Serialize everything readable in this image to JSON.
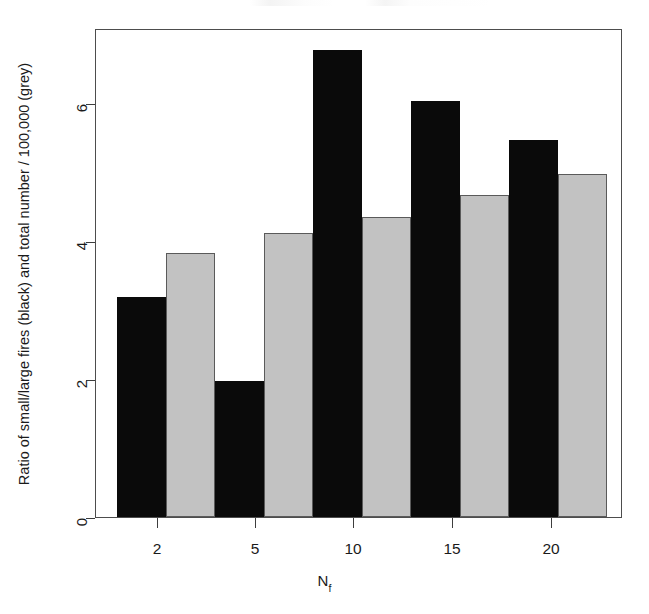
{
  "chart_data": {
    "type": "bar",
    "title": "",
    "subtitle": "",
    "xlabel": "N_f",
    "xlabel_base": "N",
    "xlabel_subscript": "f",
    "ylabel": "Ratio of small/large fires (black) and total number / 100,000 (grey)",
    "categories": [
      "2",
      "5",
      "10",
      "15",
      "20"
    ],
    "xtick_labels": [
      "2",
      "5",
      "10",
      "15",
      "20"
    ],
    "ytick_labels": [
      "0",
      "2",
      "4",
      "6"
    ],
    "ytick_values": [
      0,
      2,
      4,
      6
    ],
    "ylim": [
      0,
      7.09
    ],
    "grid": false,
    "legend_position": "none",
    "series": [
      {
        "name": "Ratio of small/large fires (black)",
        "color": "#0a0a0a",
        "border_color": "#0a0a0a",
        "values": [
          3.19,
          1.97,
          6.77,
          6.03,
          5.46
        ]
      },
      {
        "name": "Total number / 100,000 (grey)",
        "color": "#c2c2c2",
        "border_color": "#5a5a5a",
        "values": [
          3.83,
          4.11,
          4.35,
          4.67,
          4.97
        ]
      }
    ]
  },
  "layout": {
    "panel": {
      "left": 95,
      "top": 29,
      "width": 527,
      "height": 489
    },
    "baseline_y": 518,
    "px_per_unit": 69,
    "bar_width": 49,
    "group_pitch": 98,
    "first_black_left": 116,
    "y_tick_pixels": [
      518,
      380,
      242,
      104
    ],
    "x_tick_pixels": [
      157,
      255,
      353,
      452,
      551
    ]
  }
}
